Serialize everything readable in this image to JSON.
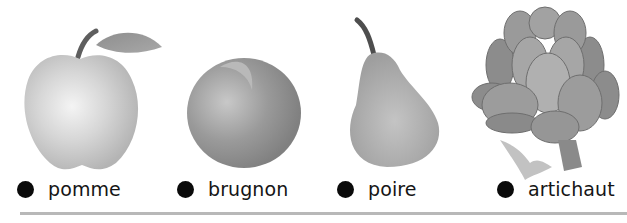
{
  "items": [
    {
      "word": "pomme",
      "image": "apple-illustration"
    },
    {
      "word": "brugnon",
      "image": "nectarine-illustration"
    },
    {
      "word": "poire",
      "image": "pear-illustration"
    },
    {
      "word": "artichaut",
      "image": "artichoke-illustration"
    }
  ],
  "colors": {
    "bullet": "#0a0a0a",
    "text": "#151515",
    "divider": "#b8b8b8"
  }
}
